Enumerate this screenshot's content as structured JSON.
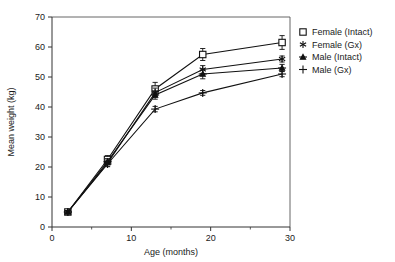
{
  "chart_data": {
    "type": "line",
    "title": "",
    "subtitle": "",
    "xlabel": "Age (months)",
    "ylabel": "Mean weight (kg)",
    "xlim": [
      0,
      30
    ],
    "ylim": [
      0,
      70
    ],
    "xticks": [
      0,
      10,
      20,
      30
    ],
    "xticks_minor": [
      5,
      15,
      25
    ],
    "yticks": [
      0,
      10,
      20,
      30,
      40,
      50,
      60,
      70
    ],
    "xtick_labels": [
      "0",
      "10",
      "20",
      "30"
    ],
    "ytick_labels": [
      "0",
      "10",
      "20",
      "30",
      "40",
      "50",
      "60",
      "70"
    ],
    "grid": false,
    "legend_position": "right",
    "x": [
      2,
      7,
      13,
      19,
      29
    ],
    "series": [
      {
        "name": "Female (Intact)",
        "marker": "open-square",
        "values": [
          5.0,
          22.5,
          46.0,
          57.5,
          61.5
        ],
        "errors": [
          0.6,
          1.3,
          2.2,
          2.0,
          2.3
        ]
      },
      {
        "name": "Female (Gx)",
        "marker": "asterisk",
        "values": [
          5.0,
          21.3,
          44.8,
          52.5,
          56.0
        ],
        "errors": [
          0.5,
          1.0,
          1.5,
          1.3,
          1.0
        ]
      },
      {
        "name": "Male (Intact)",
        "marker": "dash-triangle",
        "values": [
          5.0,
          21.8,
          44.0,
          51.0,
          53.0
        ],
        "errors": [
          0.5,
          1.0,
          1.4,
          1.6,
          1.2
        ]
      },
      {
        "name": "Male (Gx)",
        "marker": "plus",
        "values": [
          5.0,
          21.0,
          39.3,
          44.7,
          51.0
        ],
        "errors": [
          0.5,
          0.9,
          0.9,
          0.8,
          0.9
        ]
      }
    ]
  },
  "legend": {
    "items": [
      {
        "label": "Female (Intact)",
        "marker": "open-square"
      },
      {
        "label": "Female (Gx)",
        "marker": "asterisk"
      },
      {
        "label": "Male (Intact)",
        "marker": "dash-triangle"
      },
      {
        "label": "Male (Gx)",
        "marker": "plus"
      }
    ]
  },
  "colors": {
    "line": "#111111",
    "axis": "#333333",
    "frame": "#555555",
    "background": "#ffffff",
    "text": "#1a1a1a"
  }
}
